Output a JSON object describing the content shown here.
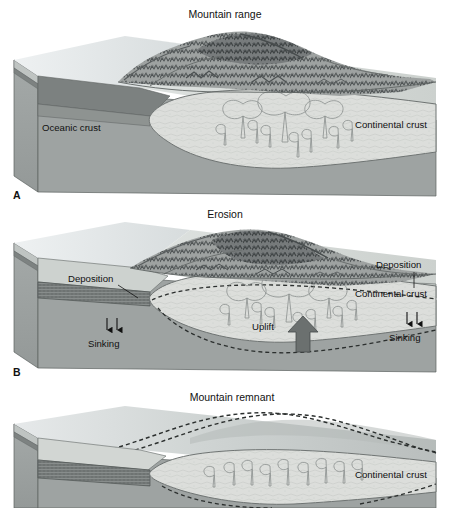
{
  "figure": {
    "panel_count": 3,
    "background_color": "#ffffff",
    "text_color": "#111111"
  },
  "palette": {
    "ocean_surface": "#e9edef",
    "ocean_surface_dark": "#d3d9dc",
    "land_surface": "#d8dcda",
    "mantle": "#9ea3a2",
    "mantle_side": "#9a9f9e",
    "mantle_side_dark": "#8d9291",
    "continental_crust": "#dcdedb",
    "continental_crust_edge": "#6f7473",
    "oceanic_crust": "#6e7372",
    "oceanic_crust_light": "#8c918f",
    "sediment": "#cfd3d0",
    "mountain_dark": "#55595a",
    "mountain_mid": "#8c908f",
    "mountain_light": "#c3c7c6",
    "arrow_fill": "#6b706f",
    "outline": "#4a4f4e",
    "dashed_line": "#2b2f2e"
  },
  "panels": [
    {
      "id": "A",
      "letter": "A",
      "title": "Mountain range",
      "labels": [
        {
          "name": "oceanic-crust-label",
          "text": "Oceanic crust"
        },
        {
          "name": "continental-crust-label",
          "text": "Continental crust"
        }
      ],
      "features": {
        "mountain_range": true,
        "crustal_root": true,
        "plutons": 6,
        "teardrops": 7,
        "erosion": false,
        "deposition": false,
        "uplift_arrow": false,
        "sinking_arrows": 0,
        "dashed_former_profiles": 0
      }
    },
    {
      "id": "B",
      "letter": "B",
      "title": "Erosion",
      "labels": [
        {
          "name": "deposition-left-label",
          "text": "Deposition"
        },
        {
          "name": "deposition-right-label",
          "text": "Deposition"
        },
        {
          "name": "continental-crust-label",
          "text": "Continental crust"
        },
        {
          "name": "sinking-left-label",
          "text": "Sinking"
        },
        {
          "name": "sinking-right-label",
          "text": "Sinking"
        },
        {
          "name": "uplift-label",
          "text": "Uplift"
        }
      ],
      "features": {
        "mountain_range": true,
        "crustal_root": true,
        "plutons": 6,
        "teardrops": 7,
        "erosion": true,
        "deposition": true,
        "uplift_arrow": true,
        "sinking_arrows": 4,
        "dashed_former_profiles": 1
      }
    },
    {
      "id": "C",
      "letter": "",
      "title": "Mountain remnant",
      "labels": [
        {
          "name": "continental-crust-label",
          "text": "Continental crust"
        }
      ],
      "features": {
        "mountain_range": false,
        "crustal_root": true,
        "plutons": 0,
        "teardrops": 9,
        "erosion": true,
        "deposition": true,
        "uplift_arrow": false,
        "sinking_arrows": 0,
        "dashed_former_profiles": 2
      }
    }
  ],
  "annotations": {
    "panel_a_title": "Mountain range",
    "panel_b_title": "Erosion",
    "panel_c_title": "Mountain remnant",
    "oceanic_crust": "Oceanic crust",
    "continental_crust": "Continental crust",
    "deposition": "Deposition",
    "sinking": "Sinking",
    "uplift": "Uplift",
    "letter_a": "A",
    "letter_b": "B"
  }
}
